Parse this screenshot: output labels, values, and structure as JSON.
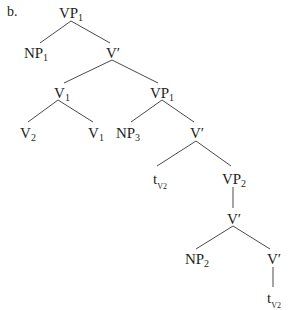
{
  "example_label": "b.",
  "nodes": [
    {
      "id": "vp1_root",
      "base": "VP",
      "sub": "1",
      "x": 71,
      "y": 5
    },
    {
      "id": "np1",
      "base": "NP",
      "sub": "1",
      "x": 36,
      "y": 45
    },
    {
      "id": "vbar_1",
      "base": "V′",
      "sub": "",
      "x": 113,
      "y": 45
    },
    {
      "id": "v1_mid",
      "base": "V",
      "sub": "1",
      "x": 62,
      "y": 85
    },
    {
      "id": "vp1_inner",
      "base": "VP",
      "sub": "1",
      "x": 162,
      "y": 85
    },
    {
      "id": "v2",
      "base": "V",
      "sub": "2",
      "x": 28,
      "y": 125
    },
    {
      "id": "v1_leaf",
      "base": "V",
      "sub": "1",
      "x": 96,
      "y": 125
    },
    {
      "id": "np3",
      "base": "NP",
      "sub": "3",
      "x": 128,
      "y": 125
    },
    {
      "id": "vbar_2",
      "base": "V′",
      "sub": "",
      "x": 197,
      "y": 125
    },
    {
      "id": "trace_1",
      "base": "t",
      "sub": "V",
      "subsub": "2",
      "x": 160,
      "y": 171
    },
    {
      "id": "vp2",
      "base": "VP",
      "sub": "2",
      "x": 234,
      "y": 171
    },
    {
      "id": "vbar_3",
      "base": "V′",
      "sub": "",
      "x": 234,
      "y": 211
    },
    {
      "id": "np2",
      "base": "NP",
      "sub": "2",
      "x": 197,
      "y": 251
    },
    {
      "id": "vbar_4",
      "base": "V′",
      "sub": "",
      "x": 274,
      "y": 251
    },
    {
      "id": "trace_2",
      "base": "t",
      "sub": "V",
      "subsub": "2",
      "x": 274,
      "y": 290
    }
  ],
  "edges": [
    {
      "from": "vp1_root",
      "to": "np1",
      "x1": 71,
      "y1": 21,
      "x2": 40,
      "y2": 43
    },
    {
      "from": "vp1_root",
      "to": "vbar_1",
      "x1": 71,
      "y1": 21,
      "x2": 110,
      "y2": 43
    },
    {
      "from": "vbar_1",
      "to": "v1_mid",
      "x1": 112,
      "y1": 60,
      "x2": 64,
      "y2": 83
    },
    {
      "from": "vbar_1",
      "to": "vp1_inner",
      "x1": 112,
      "y1": 60,
      "x2": 158,
      "y2": 83
    },
    {
      "from": "v1_mid",
      "to": "v2",
      "x1": 58,
      "y1": 100,
      "x2": 28,
      "y2": 122
    },
    {
      "from": "v1_mid",
      "to": "v1_leaf",
      "x1": 58,
      "y1": 100,
      "x2": 93,
      "y2": 122
    },
    {
      "from": "vp1_inner",
      "to": "np3",
      "x1": 162,
      "y1": 100,
      "x2": 131,
      "y2": 122
    },
    {
      "from": "vp1_inner",
      "to": "vbar_2",
      "x1": 162,
      "y1": 100,
      "x2": 194,
      "y2": 122
    },
    {
      "from": "vbar_2",
      "to": "trace_1",
      "x1": 196,
      "y1": 141,
      "x2": 157,
      "y2": 166
    },
    {
      "from": "vbar_2",
      "to": "vp2",
      "x1": 196,
      "y1": 141,
      "x2": 231,
      "y2": 166
    },
    {
      "from": "vp2",
      "to": "vbar_3",
      "x1": 233,
      "y1": 187,
      "x2": 233,
      "y2": 208
    },
    {
      "from": "vbar_3",
      "to": "np2",
      "x1": 233,
      "y1": 226,
      "x2": 196,
      "y2": 249
    },
    {
      "from": "vbar_3",
      "to": "vbar_4",
      "x1": 233,
      "y1": 226,
      "x2": 270,
      "y2": 249
    },
    {
      "from": "vbar_4",
      "to": "trace_2",
      "x1": 273,
      "y1": 267,
      "x2": 273,
      "y2": 287
    }
  ],
  "colors": {
    "ink": "#231f20",
    "line": "#4a4a4a",
    "background": "#ffffff"
  }
}
